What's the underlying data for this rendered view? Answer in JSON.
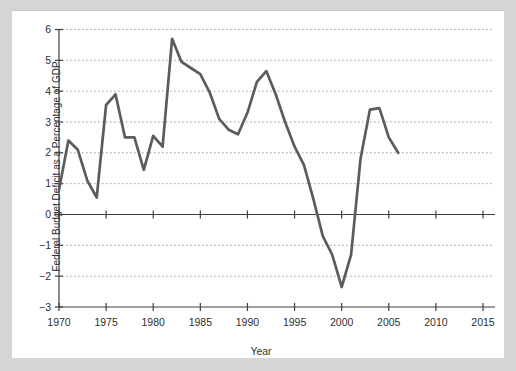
{
  "page": {
    "background_color": "#d5d5d5",
    "panel_color": "#ffffff"
  },
  "chart_data": {
    "type": "line",
    "title": "",
    "xlabel": "Year",
    "ylabel": "Federal Budget Deficit as a Percentage of GDP",
    "x": [
      1970,
      1971,
      1972,
      1973,
      1974,
      1975,
      1976,
      1977,
      1978,
      1979,
      1980,
      1981,
      1982,
      1983,
      1984,
      1985,
      1986,
      1987,
      1988,
      1989,
      1990,
      1991,
      1992,
      1993,
      1994,
      1995,
      1996,
      1997,
      1998,
      1999,
      2000,
      2001,
      2002,
      2003,
      2004,
      2005,
      2006
    ],
    "values": [
      0.8,
      2.4,
      2.1,
      1.1,
      0.55,
      3.55,
      3.9,
      2.5,
      2.5,
      1.45,
      2.55,
      2.2,
      5.7,
      4.95,
      4.75,
      4.55,
      3.95,
      3.1,
      2.75,
      2.6,
      3.3,
      4.3,
      4.65,
      3.9,
      3.0,
      2.2,
      1.6,
      0.5,
      -0.7,
      -1.3,
      -2.35,
      -1.3,
      1.8,
      3.4,
      3.45,
      2.5,
      2.0
    ],
    "xlim": [
      1970,
      2016.3
    ],
    "ylim": [
      -3,
      6
    ],
    "xticks": [
      1970,
      1975,
      1980,
      1985,
      1990,
      1995,
      2000,
      2005,
      2010,
      2015
    ],
    "xtick_labels": [
      "1970",
      "1975",
      "1980",
      "1985",
      "1990",
      "1995",
      "2000",
      "2005",
      "2010",
      "2015"
    ],
    "yticks": [
      6,
      5,
      4,
      3,
      2,
      1,
      0,
      -1,
      -2,
      -3
    ],
    "ytick_labels": [
      "6",
      "5",
      "4",
      "3",
      "2",
      "1",
      "0",
      "−1",
      "−2",
      "−3"
    ],
    "grid": "dotted horizontal lines at every integer except 0 and -3; solid line at 0 and baseline at -3",
    "legend": "none",
    "line_color": "#5c5c5c",
    "grid_color": "#9a9a9a",
    "axis_color": "#3f3f3f",
    "text_color": "#2e2e2e"
  }
}
